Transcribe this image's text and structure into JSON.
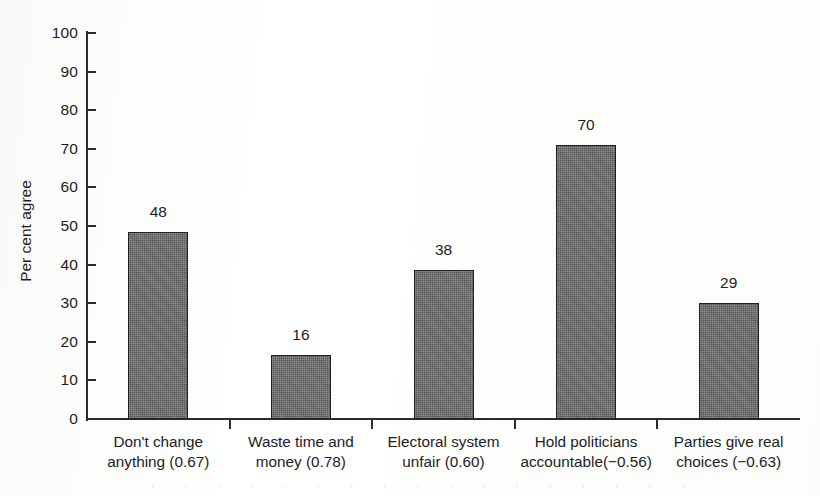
{
  "figure": {
    "background_color": "#ffffff",
    "ink_color": "#1d1d1d",
    "bar_fill_color": "#585858",
    "bar_border_color": "#212121"
  },
  "chart_data": {
    "type": "bar",
    "title": "",
    "subtitle": "",
    "xlabel": "",
    "ylabel": "Per cent agree",
    "ylim": [
      0,
      100
    ],
    "y_ticks": [
      0,
      10,
      20,
      30,
      40,
      50,
      60,
      70,
      80,
      90,
      100
    ],
    "y_tick_labels": [
      "0",
      "10",
      "20",
      "30",
      "40",
      "50",
      "60",
      "70",
      "80",
      "90",
      "100"
    ],
    "grid": false,
    "legend": "none",
    "categories": [
      "Don't change anything (0.67)",
      "Waste time and money (0.78)",
      "Electoral system unfair (0.60)",
      "Hold politicians accountable(−0.56)",
      "Parties give real choices (−0.63)"
    ],
    "category_lines": [
      [
        "Don't change",
        "anything (0.67)"
      ],
      [
        "Waste time and",
        "money (0.78)"
      ],
      [
        "Electoral system",
        "unfair (0.60)"
      ],
      [
        "Hold politicians",
        "accountable(−0.56)"
      ],
      [
        "Parties give real",
        "choices (−0.63)"
      ]
    ],
    "loadings": [
      "0.67",
      "0.78",
      "0.60",
      "−0.56",
      "−0.63"
    ],
    "values": [
      48,
      16,
      38,
      70,
      29
    ],
    "value_labels": [
      "48",
      "16",
      "38",
      "70",
      "29"
    ],
    "drawn_values": [
      48.5,
      16.5,
      38.5,
      71,
      30
    ]
  },
  "ghost_artifact": {
    "text": "· · · · · · · · · · · · · · · · · · · · · · ·"
  }
}
